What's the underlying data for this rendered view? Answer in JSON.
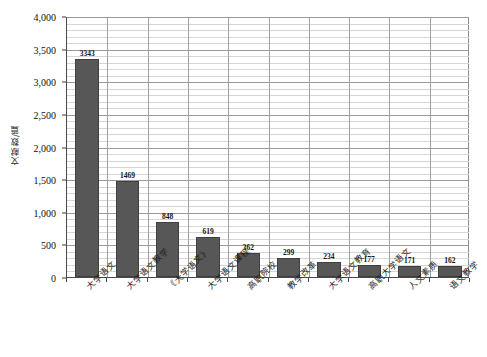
{
  "chart_data": {
    "type": "bar",
    "title": "",
    "subtitle": "",
    "xlabel": "",
    "ylabel": "文献数/篇",
    "ylim": [
      0,
      4000
    ],
    "y_tick_labels": [
      "0",
      "500",
      "1,000",
      "1,500",
      "2,000",
      "2,500",
      "3,000",
      "3,500",
      "4,000"
    ],
    "y_tick_values": [
      0,
      500,
      1000,
      1500,
      2000,
      2500,
      3000,
      3500,
      4000
    ],
    "y_major_step": 500,
    "y_minor_step": 100,
    "grid": {
      "horizontal_major": true,
      "horizontal_minor": true,
      "vertical_category_separators": true
    },
    "legend": {
      "show": false,
      "position": "none",
      "entries": []
    },
    "bar_color": "#575757",
    "plot_background": "#ffffff",
    "categories": [
      "大学语文",
      "大学语文教学",
      "《大学语文》",
      "大学语文课程",
      "高职院校",
      "教学改革",
      "大学语文教育",
      "高职大学语文",
      "人文素质",
      "语文教学"
    ],
    "values": [
      3343,
      1469,
      848,
      619,
      362,
      299,
      234,
      177,
      171,
      162
    ],
    "data_labels": [
      "3343",
      "1469",
      "848",
      "619",
      "362",
      "299",
      "234",
      "177",
      "171",
      "162"
    ]
  }
}
